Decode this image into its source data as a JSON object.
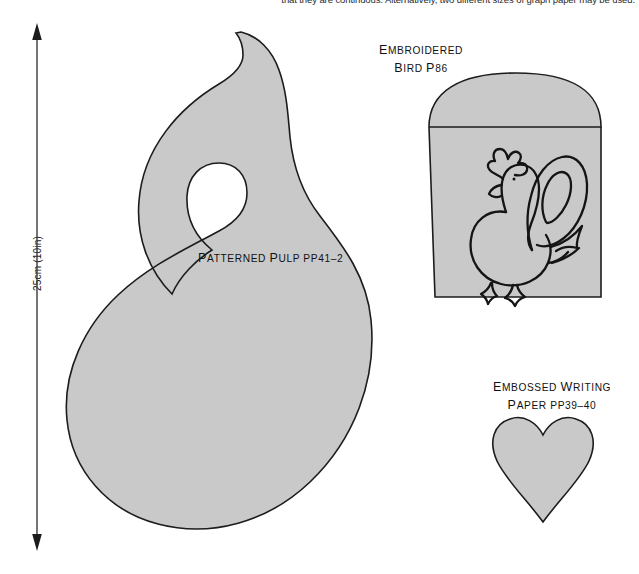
{
  "page": {
    "background_color": "#ffffff",
    "shape_fill_color": "#c9c9c9",
    "shape_outline_color": "#1c1c1c"
  },
  "header": {
    "running_text": "that they are continuous. Alternatively, two different sizes of graph paper may be used."
  },
  "scale": {
    "label": "25cm (10in)",
    "arrow_name": "double-headed-vertical-arrow"
  },
  "templates": [
    {
      "id": "patterned-pulp",
      "shape": "spiral-comma",
      "caption_lines": [
        "Patterned Pulp pp41–2"
      ],
      "caption_line_1_big": "P",
      "caption_parts": {
        "line1_lead": "P",
        "line1_rest": "ATTERNED ",
        "line1_lead2": "P",
        "line1_rest2": "ULP ",
        "line1_tail": "pp41–2"
      }
    },
    {
      "id": "embroidered-bird",
      "shape": "arched-bag",
      "caption_lines": [
        "Embroidered",
        "Bird p86"
      ],
      "motif": "rooster-bird-drawing"
    },
    {
      "id": "embossed-writing-paper",
      "shape": "heart",
      "caption_lines": [
        "Embossed Writing",
        "Paper pp39–40"
      ]
    }
  ],
  "captions": {
    "bird": {
      "line1_cap": "E",
      "line1_rest": "MBROIDERED",
      "line2_cap": "B",
      "line2_rest": "IRD ",
      "line2_tail_cap": "P",
      "line2_tail": "86"
    },
    "pulp": {
      "cap1": "P",
      "rest1": "ATTERNED ",
      "cap2": "P",
      "rest2": "ULP ",
      "tail_cap": "PP",
      "tail": "41–2"
    },
    "paper": {
      "line1_cap": "E",
      "line1_rest": "MBOSSED ",
      "line1_cap2": "W",
      "line1_rest2": "RITING",
      "line2_cap": "P",
      "line2_rest": "APER ",
      "line2_tail_cap": "PP",
      "line2_tail": "39–40"
    }
  }
}
